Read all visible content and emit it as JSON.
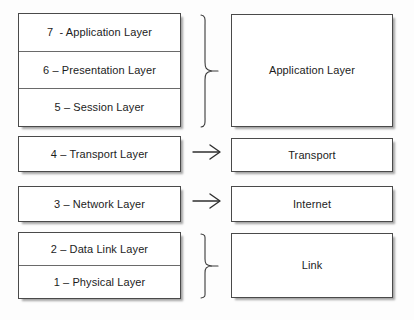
{
  "diagram": {
    "background_color": "#ffffff",
    "line_color": "#4a4a4a",
    "text_color": "#1c1c1c"
  },
  "osi_stack": {
    "upper_group": {
      "layers": [
        {
          "label": "7  - Application Layer",
          "number": "7",
          "name": "Application Layer"
        },
        {
          "label": "6 – Presentation Layer",
          "number": "6",
          "name": "Presentation Layer"
        },
        {
          "label": "5 – Session Layer",
          "number": "5",
          "name": "Session Layer"
        }
      ]
    },
    "transport": {
      "label": "4 – Transport Layer",
      "number": "4",
      "name": "Transport Layer"
    },
    "network": {
      "label": "3 – Network Layer",
      "number": "3",
      "name": "Network Layer"
    },
    "lower_group": {
      "layers": [
        {
          "label": "2 – Data Link Layer",
          "number": "2",
          "name": "Data Link Layer"
        },
        {
          "label": "1 – Physical Layer",
          "number": "1",
          "name": "Physical Layer"
        }
      ]
    }
  },
  "tcpip_stack": {
    "application": {
      "label": "Application Layer"
    },
    "transport": {
      "label": "Transport"
    },
    "internet": {
      "label": "Internet"
    },
    "link": {
      "label": "Link"
    }
  },
  "connectors": {
    "brace_upper": {
      "icon": "curly-brace-right"
    },
    "brace_lower": {
      "icon": "curly-brace-right"
    },
    "arrow_transport": {
      "icon": "arrow-right"
    },
    "arrow_internet": {
      "icon": "arrow-right"
    }
  }
}
